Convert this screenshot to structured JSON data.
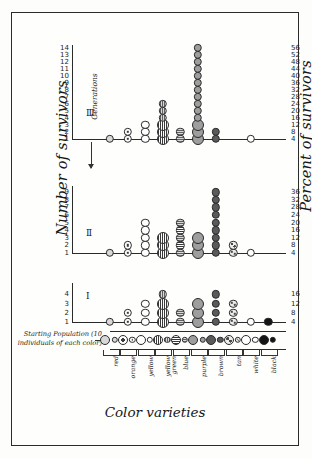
{
  "figure": {
    "y_axis_left_label": "Number of survivors",
    "y_axis_right_label": "Percent of survivors",
    "x_axis_label": "Color varieties",
    "generations_label": "Generations",
    "starting_population_label": "Starting\nPopulation\n(10 individuals\nof each color)"
  },
  "color_varieties": [
    {
      "name": "red",
      "style": "fill-light"
    },
    {
      "name": "orange",
      "style": "fill-ring"
    },
    {
      "name": "yellow",
      "style": "fill-open"
    },
    {
      "name": "yellow\ngreen",
      "style": "fill-hatchv"
    },
    {
      "name": "blue",
      "style": "fill-hatchh"
    },
    {
      "name": "purple",
      "style": "fill-mid"
    },
    {
      "name": "brown",
      "style": "fill-dark"
    },
    {
      "name": "tan",
      "style": "fill-speck"
    },
    {
      "name": "white",
      "style": "fill-open"
    },
    {
      "name": "black",
      "style": "fill-solid"
    }
  ],
  "panels": [
    {
      "id": "III",
      "roman": "Ⅲ",
      "y_ticks": [
        1,
        2,
        3,
        4,
        5,
        6,
        7,
        8,
        9,
        10,
        11,
        12,
        13,
        14
      ],
      "percent_ticks": [
        4,
        8,
        12,
        16,
        20,
        24,
        28,
        32,
        36,
        40,
        44,
        48,
        52,
        56
      ],
      "counts_by_color": [
        1,
        2,
        3,
        6,
        2,
        14,
        2,
        0,
        1,
        0
      ]
    },
    {
      "id": "II",
      "roman": "Ⅱ",
      "y_ticks": [
        1,
        2,
        3,
        4,
        5,
        6,
        7,
        8,
        9
      ],
      "percent_ticks": [
        4,
        8,
        12,
        16,
        20,
        24,
        28,
        32,
        36
      ],
      "counts_by_color": [
        1,
        2,
        5,
        3,
        5,
        3,
        9,
        2,
        1,
        0
      ]
    },
    {
      "id": "I",
      "roman": "Ⅰ",
      "y_ticks": [
        1,
        2,
        3,
        4
      ],
      "percent_ticks": [
        4,
        8,
        12,
        16
      ],
      "counts_by_color": [
        1,
        2,
        3,
        4,
        2,
        3,
        4,
        3,
        1,
        1
      ]
    }
  ],
  "chart_data": {
    "type": "scatter",
    "title": "",
    "xlabel": "Color varieties",
    "ylabel": "Number of survivors",
    "ylabel_right": "Percent of survivors",
    "categories": [
      "red",
      "orange",
      "yellow",
      "yellow green",
      "blue",
      "purple",
      "brown",
      "tan",
      "white",
      "black"
    ],
    "series": [
      {
        "name": "Generation I",
        "values": [
          1,
          2,
          3,
          4,
          2,
          3,
          4,
          3,
          1,
          1
        ],
        "ylim": [
          0,
          4
        ],
        "percent_per_unit": 4
      },
      {
        "name": "Generation II",
        "values": [
          1,
          2,
          5,
          3,
          5,
          3,
          9,
          2,
          1,
          0
        ],
        "ylim": [
          0,
          9
        ],
        "percent_per_unit": 4
      },
      {
        "name": "Generation III",
        "values": [
          1,
          2,
          3,
          6,
          2,
          14,
          2,
          0,
          1,
          0
        ],
        "ylim": [
          0,
          14
        ],
        "percent_per_unit": 4
      }
    ],
    "starting_population": {
      "individuals_per_color": 10,
      "note": "10 individuals of each color"
    },
    "grid": false,
    "legend": "none",
    "annotations": [
      "Generations (arrow pointing upward through panels I → II → III)"
    ]
  }
}
